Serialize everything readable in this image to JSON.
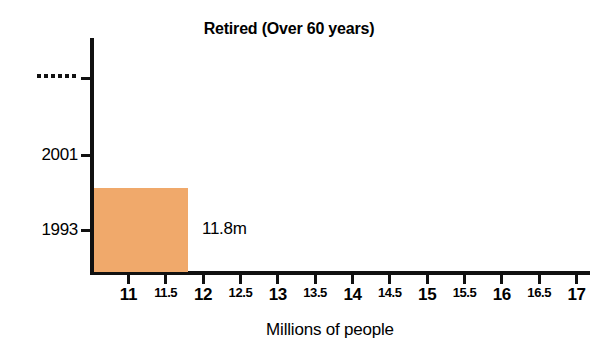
{
  "chart_data": {
    "type": "bar",
    "orientation": "horizontal",
    "title": "Retired (Over 60 years)",
    "xlabel": "Millions of people",
    "ylabel": "",
    "categories": [
      "1993",
      "2001",
      "…"
    ],
    "values": [
      11.8,
      null,
      null
    ],
    "data_labels": [
      "11.8m",
      "",
      ""
    ],
    "series": [
      {
        "name": "Retired (Over 60 years)",
        "categories": [
          "1993",
          "2001",
          "…"
        ],
        "values": [
          11.8,
          null,
          null
        ]
      }
    ],
    "xlim": [
      10.54,
      17.18
    ],
    "xticks": [
      11,
      11.5,
      12,
      12.5,
      13,
      13.5,
      14,
      14.5,
      15,
      15.5,
      16,
      16.5,
      17
    ],
    "xtick_labels": [
      "11",
      "11.5",
      "12",
      "12.5",
      "13",
      "13.5",
      "14",
      "14.5",
      "15",
      "15.5",
      "16",
      "16.5",
      "17"
    ],
    "grid": false,
    "legend": false,
    "bar_color": "#F0A96B",
    "axis_color": "#111111",
    "background": "#ffffff"
  },
  "chart": {
    "title": "Retired (Over 60 years)",
    "x_axis_title": "Millions of people",
    "y_axis": {
      "ticks": [
        {
          "id": "ellipsis",
          "label": "…",
          "kind": "ellipsis"
        },
        {
          "id": "2001",
          "label": "2001",
          "kind": "year"
        },
        {
          "id": "1993",
          "label": "1993",
          "kind": "year"
        }
      ]
    },
    "x_axis": {
      "ticks": [
        {
          "label": "11",
          "value": 11,
          "kind": "major"
        },
        {
          "label": "11.5",
          "value": 11.5,
          "kind": "minor"
        },
        {
          "label": "12",
          "value": 12,
          "kind": "major"
        },
        {
          "label": "12.5",
          "value": 12.5,
          "kind": "minor"
        },
        {
          "label": "13",
          "value": 13,
          "kind": "major"
        },
        {
          "label": "13.5",
          "value": 13.5,
          "kind": "minor"
        },
        {
          "label": "14",
          "value": 14,
          "kind": "major"
        },
        {
          "label": "14.5",
          "value": 14.5,
          "kind": "minor"
        },
        {
          "label": "15",
          "value": 15,
          "kind": "major"
        },
        {
          "label": "15.5",
          "value": 15.5,
          "kind": "minor"
        },
        {
          "label": "16",
          "value": 16,
          "kind": "major"
        },
        {
          "label": "16.5",
          "value": 16.5,
          "kind": "minor"
        },
        {
          "label": "17",
          "value": 17,
          "kind": "major"
        }
      ]
    },
    "bars": [
      {
        "category": "1993",
        "value": 11.8,
        "label": "11.8m",
        "color": "#F0A96B"
      }
    ]
  }
}
